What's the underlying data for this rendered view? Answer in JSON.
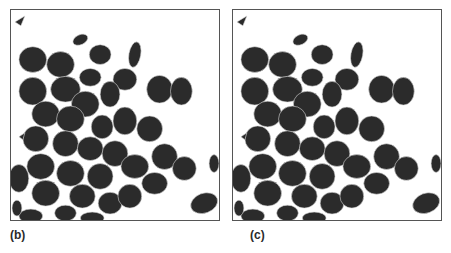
{
  "figure": {
    "panels": [
      {
        "id": "b",
        "label": "(b)",
        "content": "binary image of dark blob particles with light watershed/skeleton lines"
      },
      {
        "id": "c",
        "label": "(c)",
        "content": "binary image of dark blob particles with light watershed/skeleton lines (variant)"
      }
    ],
    "colors": {
      "blob": "#2b2b2b",
      "line": "#d8d8d8",
      "border": "#555555",
      "background": "#ffffff"
    }
  }
}
